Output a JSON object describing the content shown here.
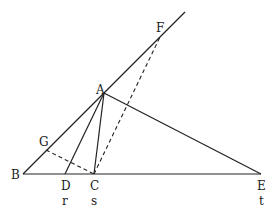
{
  "diagram": {
    "type": "geometry",
    "points": {
      "A": {
        "label": "A",
        "x": 104,
        "y": 93
      },
      "B": {
        "label": "B",
        "x": 23,
        "y": 174
      },
      "C": {
        "label": "C",
        "x": 94,
        "y": 174,
        "sublabel": "s"
      },
      "D": {
        "label": "D",
        "x": 65,
        "y": 174,
        "sublabel": "r"
      },
      "E": {
        "label": "E",
        "x": 261,
        "y": 174,
        "sublabel": "t"
      },
      "F": {
        "label": "F",
        "x": 160,
        "y": 37
      },
      "G": {
        "label": "G",
        "x": 46,
        "y": 150
      }
    },
    "segments_solid": [
      "B-E",
      "B-F (ray extended)",
      "A-D",
      "A-C",
      "A-E"
    ],
    "segments_dashed": [
      "C-F",
      "G-C"
    ],
    "labels": {
      "A": "A",
      "B": "B",
      "C": "C",
      "D": "D",
      "E": "E",
      "F": "F",
      "G": "G",
      "r": "r",
      "s": "s",
      "t": "t"
    }
  }
}
